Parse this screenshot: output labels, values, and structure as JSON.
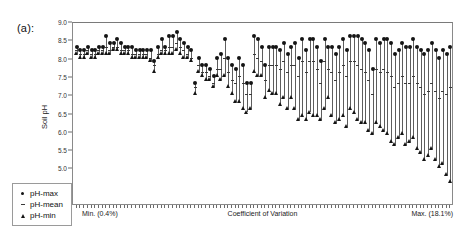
{
  "panel": {
    "label": "(a):"
  },
  "chart_data": {
    "type": "scatter",
    "title": "",
    "xlabel": "Coefficient of Variation",
    "ylabel": "Soil pH",
    "ylim": [
      4.0,
      9.0
    ],
    "ytick_labels": [
      "9.0",
      "8.5",
      "8.0",
      "7.5",
      "7.0",
      "6.5",
      "6.0",
      "5.5",
      "5.0",
      "4.5",
      "4.0"
    ],
    "ytick_values": [
      9.0,
      8.5,
      8.0,
      7.5,
      7.0,
      6.5,
      6.0,
      5.5,
      5.0,
      4.5,
      4.0
    ],
    "grid": false,
    "x_axis_annotations": {
      "min_label": "Min. (0.4%)",
      "center_label": "Coefficient of Variation",
      "max_label": "Max. (18.1%)"
    },
    "legend": {
      "position": "lower-left-inside",
      "entries": [
        {
          "label": "pH-max",
          "marker": "filled-circle"
        },
        {
          "label": "pH-mean",
          "marker": "small-dash"
        },
        {
          "label": "pH-min",
          "marker": "filled-triangle"
        }
      ]
    },
    "series": [
      {
        "name": "pH-max",
        "values": [
          8.3,
          8.2,
          8.2,
          8.3,
          8.2,
          8.2,
          8.3,
          8.3,
          8.6,
          8.4,
          8.4,
          8.5,
          8.4,
          8.3,
          8.3,
          8.3,
          8.2,
          8.2,
          8.2,
          8.2,
          8.2,
          7.9,
          8.3,
          8.5,
          8.3,
          8.6,
          8.6,
          8.7,
          8.5,
          8.4,
          8.3,
          8.2,
          7.3,
          8.0,
          7.8,
          7.8,
          7.7,
          7.5,
          8.0,
          8.1,
          8.5,
          8.0,
          7.8,
          7.7,
          8.0,
          7.8,
          7.3,
          7.3,
          8.6,
          8.5,
          8.3,
          7.8,
          8.3,
          8.3,
          8.3,
          8.2,
          8.4,
          8.1,
          8.3,
          8.4,
          8.0,
          8.5,
          8.2,
          8.5,
          8.5,
          8.3,
          7.9,
          8.5,
          8.3,
          8.3,
          8.1,
          8.3,
          8.5,
          8.2,
          8.6,
          8.6,
          8.6,
          8.5,
          8.4,
          8.2,
          7.7,
          8.5,
          8.4,
          8.5,
          8.5,
          8.4,
          8.1,
          8.2,
          8.4,
          8.3,
          8.3,
          8.5,
          8.3,
          8.2,
          8.1,
          8.2,
          8.4,
          8.2,
          8.0,
          8.2,
          8.1,
          8.3
        ]
      },
      {
        "name": "pH-mean",
        "values": [
          8.2,
          8.1,
          8.1,
          8.2,
          8.1,
          8.1,
          8.2,
          8.2,
          8.3,
          8.2,
          8.3,
          8.3,
          8.2,
          8.2,
          8.2,
          8.1,
          8.1,
          8.1,
          8.1,
          8.1,
          8.0,
          7.8,
          8.1,
          8.2,
          8.2,
          8.3,
          8.3,
          8.4,
          8.3,
          8.2,
          8.1,
          8.0,
          7.2,
          7.8,
          7.6,
          7.6,
          7.5,
          7.3,
          7.7,
          7.7,
          8.0,
          7.6,
          7.4,
          7.3,
          7.5,
          7.3,
          7.0,
          7.0,
          8.1,
          8.0,
          7.9,
          7.4,
          7.8,
          7.8,
          7.8,
          7.7,
          7.9,
          7.6,
          7.8,
          7.8,
          7.5,
          7.9,
          7.6,
          7.9,
          7.9,
          7.7,
          7.3,
          7.9,
          7.7,
          7.6,
          7.4,
          7.6,
          7.8,
          7.5,
          7.9,
          7.9,
          7.8,
          7.7,
          7.6,
          7.4,
          7.0,
          7.7,
          7.6,
          7.7,
          7.6,
          7.5,
          7.2,
          7.3,
          7.5,
          7.3,
          7.3,
          7.5,
          7.3,
          7.2,
          7.0,
          7.1,
          7.3,
          7.1,
          6.9,
          7.1,
          7.0,
          7.2
        ]
      },
      {
        "name": "pH-min",
        "values": [
          8.1,
          8.0,
          8.0,
          8.1,
          8.0,
          8.0,
          8.1,
          8.1,
          8.1,
          8.1,
          8.2,
          8.2,
          8.1,
          8.1,
          8.1,
          8.0,
          8.0,
          8.0,
          8.0,
          8.0,
          7.9,
          7.6,
          8.0,
          8.1,
          8.1,
          8.1,
          8.1,
          8.2,
          8.1,
          8.0,
          8.0,
          7.9,
          7.0,
          7.6,
          7.5,
          7.4,
          7.4,
          7.2,
          7.5,
          7.4,
          7.5,
          7.2,
          7.0,
          6.8,
          6.8,
          6.6,
          6.5,
          6.6,
          7.6,
          7.5,
          7.5,
          6.9,
          7.1,
          7.0,
          7.0,
          6.7,
          6.9,
          6.6,
          6.9,
          6.6,
          6.3,
          6.4,
          6.3,
          6.5,
          6.4,
          6.4,
          6.3,
          6.6,
          6.9,
          6.4,
          6.2,
          6.3,
          6.4,
          6.1,
          6.6,
          6.5,
          6.3,
          6.2,
          6.2,
          6.0,
          5.9,
          6.2,
          6.1,
          6.0,
          5.9,
          5.7,
          5.6,
          5.8,
          5.9,
          5.6,
          5.7,
          5.8,
          5.5,
          5.4,
          5.2,
          5.3,
          5.5,
          5.2,
          5.0,
          5.1,
          4.8,
          4.6
        ]
      }
    ]
  }
}
